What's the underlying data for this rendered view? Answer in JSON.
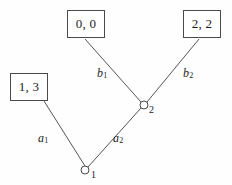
{
  "figure": {
    "name": "extensive-form-game-tree",
    "background_color": "#fefefe",
    "line_color": "#55555a",
    "text_color": "#1c1c1c",
    "width": 232,
    "height": 185
  },
  "payoff_boxes": [
    {
      "id": "left",
      "label": "1, 3",
      "x": 10,
      "y": 73,
      "width": 38,
      "height": 28
    },
    {
      "id": "top",
      "label": "0, 0",
      "x": 67,
      "y": 10,
      "width": 38,
      "height": 28
    },
    {
      "id": "right",
      "label": "2, 2",
      "x": 183,
      "y": 10,
      "width": 38,
      "height": 28
    }
  ],
  "nodes": [
    {
      "id": "node1",
      "label": "1",
      "x": 85,
      "y": 170,
      "radius": 4
    },
    {
      "id": "node2",
      "label": "2",
      "x": 144,
      "y": 105,
      "radius": 4
    }
  ],
  "edges": [
    {
      "id": "a1",
      "base": "a",
      "sub": "1",
      "from": "node1",
      "to": "payoff-left",
      "x1": 85,
      "y1": 166,
      "x2": 44,
      "y2": 101
    },
    {
      "id": "a2",
      "base": "a",
      "sub": "2",
      "from": "node1",
      "to": "node2",
      "x1": 88,
      "y1": 167,
      "x2": 141,
      "y2": 108
    },
    {
      "id": "b1",
      "base": "b",
      "sub": "1",
      "from": "node2",
      "to": "payoff-top",
      "x1": 141,
      "y1": 102,
      "x2": 85,
      "y2": 39
    },
    {
      "id": "b2",
      "base": "b",
      "sub": "2",
      "from": "node2",
      "to": "payoff-right",
      "x1": 147,
      "y1": 102,
      "x2": 199,
      "y2": 39
    }
  ]
}
